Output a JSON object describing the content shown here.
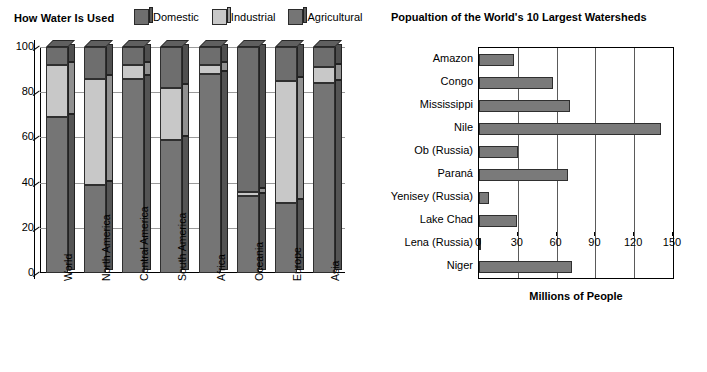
{
  "colors": {
    "domestic": "#6e6e6e",
    "industrial": "#c8c8c8",
    "agricultural": "#757575",
    "hbar": "#7a7a7a",
    "outline": "#2f2f2f",
    "grid": "#9a9a9a",
    "background": "#ffffff"
  },
  "left_chart": {
    "title": "How Water Is Used",
    "legend": [
      {
        "label": "Domestic",
        "color": "#6e6e6e",
        "icon": "legend-swatch-domestic"
      },
      {
        "label": "Industrial",
        "color": "#c8c8c8",
        "icon": "legend-swatch-industrial"
      },
      {
        "label": "Agricultural",
        "color": "#757575",
        "icon": "legend-swatch-agricultural"
      }
    ],
    "y_axis_label": "Percent",
    "y_ticks": [
      "0",
      "20",
      "40",
      "60",
      "80",
      "100"
    ]
  },
  "right_chart": {
    "title": "Popualtion of the World's 10 Largest Watersheds",
    "x_axis_label": "Millions of People",
    "x_ticks": [
      "0",
      "30",
      "60",
      "90",
      "120",
      "150"
    ]
  },
  "chart_data": [
    {
      "type": "bar",
      "subtype": "stacked-column-100",
      "title": "How Water Is Used",
      "xlabel": "",
      "ylabel": "Percent",
      "ylim": [
        0,
        100
      ],
      "yticks": [
        0,
        20,
        40,
        60,
        80,
        100
      ],
      "grid": true,
      "legend_position": "top-right",
      "categories": [
        "World",
        "North America",
        "Central America",
        "South America",
        "Africa",
        "Oceania",
        "Europe",
        "Asia"
      ],
      "series": [
        {
          "name": "Agricultural",
          "color": "#757575",
          "values": [
            69,
            39,
            86,
            59,
            88,
            34,
            31,
            84
          ]
        },
        {
          "name": "Industrial",
          "color": "#c8c8c8",
          "values": [
            23,
            47,
            6,
            23,
            4,
            2,
            54,
            7
          ]
        },
        {
          "name": "Domestic",
          "color": "#6e6e6e",
          "values": [
            8,
            14,
            8,
            18,
            8,
            64,
            15,
            9
          ]
        }
      ]
    },
    {
      "type": "bar",
      "subtype": "horizontal",
      "title": "Popualtion of the World's 10 Largest Watersheds",
      "xlabel": "Millions of People",
      "ylabel": "",
      "xlim": [
        0,
        150
      ],
      "xticks": [
        0,
        30,
        60,
        90,
        120,
        150
      ],
      "grid": true,
      "legend_position": "none",
      "categories": [
        "Amazon",
        "Congo",
        "Mississippi",
        "Nile",
        "Ob (Russia)",
        "Paraná",
        "Yenisey (Russia)",
        "Lake Chad",
        "Lena (Russia)",
        "Niger"
      ],
      "values": [
        27,
        57,
        70,
        141,
        30,
        69,
        8,
        29,
        0.5,
        72
      ]
    }
  ]
}
